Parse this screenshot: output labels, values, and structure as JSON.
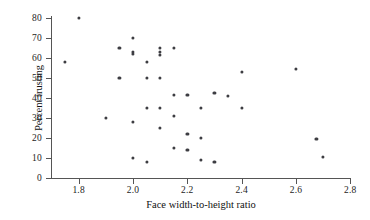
{
  "chart_data": {
    "type": "scatter",
    "title": "",
    "xlabel": "Face width-to-height ratio",
    "ylabel": "Percent trusting",
    "xlim": [
      1.7,
      2.8
    ],
    "ylim": [
      0,
      82
    ],
    "xticks": [
      1.8,
      2.0,
      2.2,
      2.4,
      2.6,
      2.8
    ],
    "xticklabels": [
      "1.8",
      "2.0",
      "2.2",
      "2.4",
      "2.6",
      "2.8"
    ],
    "yticks": [
      0,
      10,
      20,
      30,
      40,
      50,
      60,
      70,
      80
    ],
    "yticklabels": [
      "0",
      "10",
      "20",
      "30",
      "40",
      "50",
      "60",
      "70",
      "80"
    ],
    "grid": false,
    "legend": null,
    "marker_color": "#3d3d42",
    "points": [
      {
        "x": 1.75,
        "y": 58
      },
      {
        "x": 1.8,
        "y": 80
      },
      {
        "x": 1.9,
        "y": 30
      },
      {
        "x": 1.95,
        "y": 65
      },
      {
        "x": 1.95,
        "y": 50
      },
      {
        "x": 2.0,
        "y": 70
      },
      {
        "x": 2.0,
        "y": 63
      },
      {
        "x": 2.0,
        "y": 62
      },
      {
        "x": 2.0,
        "y": 28
      },
      {
        "x": 2.0,
        "y": 10
      },
      {
        "x": 2.05,
        "y": 58
      },
      {
        "x": 2.05,
        "y": 50
      },
      {
        "x": 2.05,
        "y": 35
      },
      {
        "x": 2.05,
        "y": 8
      },
      {
        "x": 2.1,
        "y": 65
      },
      {
        "x": 2.1,
        "y": 63
      },
      {
        "x": 2.1,
        "y": 61.5
      },
      {
        "x": 2.1,
        "y": 50
      },
      {
        "x": 2.1,
        "y": 35
      },
      {
        "x": 2.1,
        "y": 25
      },
      {
        "x": 2.15,
        "y": 65
      },
      {
        "x": 2.15,
        "y": 41.5
      },
      {
        "x": 2.15,
        "y": 31
      },
      {
        "x": 2.15,
        "y": 15
      },
      {
        "x": 2.2,
        "y": 41.5
      },
      {
        "x": 2.2,
        "y": 22
      },
      {
        "x": 2.2,
        "y": 14
      },
      {
        "x": 2.25,
        "y": 35
      },
      {
        "x": 2.25,
        "y": 20
      },
      {
        "x": 2.25,
        "y": 9
      },
      {
        "x": 2.3,
        "y": 42.5
      },
      {
        "x": 2.3,
        "y": 8
      },
      {
        "x": 2.35,
        "y": 41
      },
      {
        "x": 2.4,
        "y": 53
      },
      {
        "x": 2.4,
        "y": 35
      },
      {
        "x": 2.6,
        "y": 54.5
      },
      {
        "x": 2.675,
        "y": 19.5
      },
      {
        "x": 2.7,
        "y": 10.5
      }
    ]
  }
}
